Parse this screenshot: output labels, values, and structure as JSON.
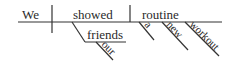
{
  "diagram": {
    "type": "sentence-diagram",
    "sentence_words": {
      "subject": "We",
      "verb": "showed",
      "direct_object": "routine",
      "indirect_object": "friends",
      "indirect_object_modifier": "our",
      "object_modifiers": [
        "a",
        "new",
        "workout"
      ]
    }
  }
}
